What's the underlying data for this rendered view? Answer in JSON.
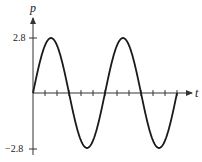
{
  "chart_data": {
    "type": "line",
    "title": "",
    "xlabel": "t",
    "ylabel": "p",
    "yticks": [
      2.8,
      -2.8
    ],
    "ytick_labels": [
      "2.8",
      "−2.8"
    ],
    "x_tick_count": 12,
    "ylim": [
      -2.8,
      2.8
    ],
    "grid": false,
    "legend": null,
    "series": [
      {
        "name": "p(t)",
        "function": "2.8*sin(t)",
        "amplitude": 2.8,
        "periods": 2,
        "start_phase": 0
      }
    ]
  },
  "labels": {
    "x_axis": "t",
    "y_axis": "p",
    "y_top": "2.8",
    "y_bottom": "−2.8"
  },
  "colors": {
    "curve": "#1a1a1a",
    "axis": "#333333"
  }
}
